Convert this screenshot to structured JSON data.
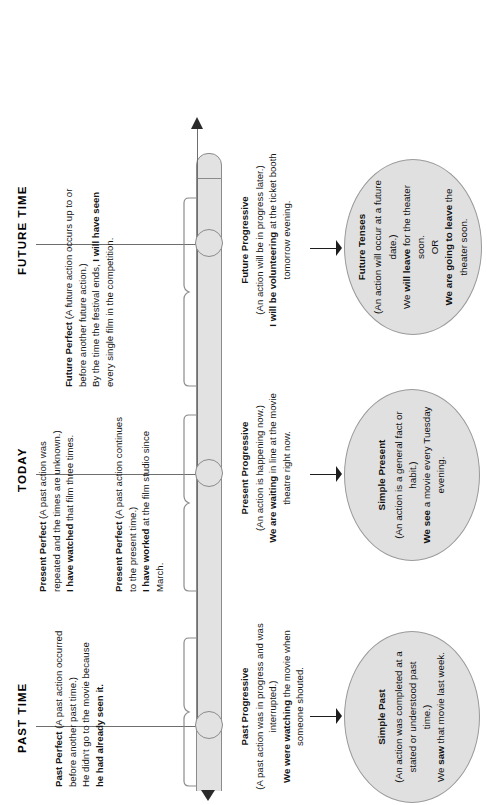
{
  "diagram": {
    "title_headers": [
      {
        "id": "past-time",
        "label": "PAST TIME"
      },
      {
        "id": "today",
        "label": "TODAY"
      },
      {
        "id": "future-time",
        "label": "FUTURE TIME"
      }
    ],
    "upper_blocks": [
      {
        "id": "past-perfect",
        "tense": "Past Perfect",
        "definition": "(A past action occurred before another past time.)",
        "lines": [
          {
            "plain": "Past Perfect",
            "bold": true
          },
          {
            "plain": " (A past action occurred"
          },
          {
            "plain": "before another past time.)"
          },
          {
            "plain": "He didn't go to the movie because"
          },
          {
            "plain": "he had already seen it.",
            "bold": true
          }
        ],
        "example_plain": "He didn't go to the movie because",
        "example_bold": "he had already seen it."
      },
      {
        "id": "present-perfect-repeated",
        "tense": "Present Perfect",
        "definition": "(A past action was repeated and the times are unknown.)",
        "example_bold_1": "I have watched",
        "example_plain_1": " that film three times."
      },
      {
        "id": "present-perfect-continues",
        "tense": "Present Perfect",
        "definition": "(A past action continues to the present time.)",
        "example_bold_1": "I have worked",
        "example_plain_1": " at the film studio since March."
      },
      {
        "id": "future-perfect",
        "tense": "Future Perfect",
        "definition": "(A future action occurs up to or before another future action.)",
        "example_plain_1": "By the time the festival ends, ",
        "example_bold_1": "I will have seen",
        "example_plain_2": " every single film in the competition."
      }
    ],
    "lower_blocks": [
      {
        "id": "past-progressive",
        "tense": "Past Progressive",
        "definition": "(A past action was in progress and was interrupted.)",
        "example_bold_1": "We were watching",
        "example_plain_1": " the movie when someone shouted."
      },
      {
        "id": "present-progressive",
        "tense": "Present Progressive",
        "definition": "(An action is happening now.)",
        "example_bold_1": "We are waiting",
        "example_plain_1": " in line at the movie theatre right now."
      },
      {
        "id": "future-progressive",
        "tense": "Future Progressive",
        "definition": "(An action will be in progress later.)",
        "example_bold_1": "I will be volunteering",
        "example_plain_1": " at the ticket booth tomorrow evening."
      }
    ],
    "ovals": [
      {
        "id": "simple-past",
        "title": "Simple Past",
        "definition": "(An action was completed at a stated or understood past time.)",
        "example_plain_1": "We ",
        "example_bold_1": "saw",
        "example_plain_2": " that movie last week."
      },
      {
        "id": "simple-present",
        "title": "Simple Present",
        "definition": "(An action is a general fact or habit.)",
        "example_bold_1": "We see",
        "example_plain_1": " a movie every Tuesday evening."
      },
      {
        "id": "future-tenses",
        "title": "Future Tenses",
        "definition": "(An action will occur at a future date.)",
        "example_plain_1": "We ",
        "example_bold_1": "will leave",
        "example_plain_2": " for the theater soon.",
        "or_label": "OR",
        "example_bold_2": "We are going to leave",
        "example_plain_3": " the theater soon."
      }
    ],
    "colors": {
      "bar_fill": "#e2e2e2",
      "bar_stroke": "#8b8b8b",
      "oval_fill": "#e0e0e0",
      "oval_stroke": "#9a9a9a",
      "arrow": "#1d1d1d",
      "text": "#111111",
      "marker_line": "#6e6e6e"
    }
  }
}
